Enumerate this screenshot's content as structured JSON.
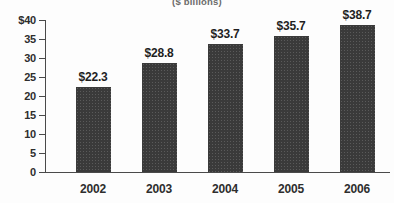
{
  "chart_data": {
    "type": "bar",
    "title": "($ billions)",
    "xlabel": "",
    "ylabel": "",
    "categories": [
      "2002",
      "2003",
      "2004",
      "2005",
      "2006"
    ],
    "values": [
      22.3,
      28.8,
      33.7,
      35.7,
      38.7
    ],
    "value_labels": [
      "$22.3",
      "$28.8",
      "$33.7",
      "$35.7",
      "$38.7"
    ],
    "ylim": [
      0,
      40
    ],
    "ytick_values": [
      40,
      35,
      30,
      25,
      20,
      15,
      10,
      5,
      0
    ],
    "ytick_labels": [
      "$40",
      "35",
      "30",
      "25",
      "20",
      "15",
      "10",
      "5",
      "0"
    ],
    "grid": false,
    "legend": null,
    "bar_color": "#3a3a3a",
    "axis_color": "#4a4a4a",
    "background_color": "#fdfdfd"
  }
}
